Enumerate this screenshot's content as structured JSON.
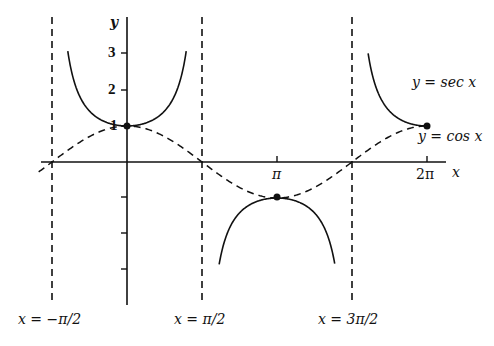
{
  "chart_data": {
    "type": "line",
    "title": "",
    "xlabel": "x",
    "ylabel": "y",
    "x_ticks": [
      {
        "value": 3.14159,
        "label": "π"
      },
      {
        "value": 6.28318,
        "label": "2π"
      }
    ],
    "y_ticks": [
      {
        "value": 1,
        "label": "1"
      },
      {
        "value": 2,
        "label": "2"
      },
      {
        "value": 3,
        "label": "3"
      },
      {
        "value": -1,
        "label": ""
      },
      {
        "value": -2,
        "label": ""
      },
      {
        "value": -3,
        "label": ""
      }
    ],
    "xlim": [
      -1.97,
      7.3
    ],
    "ylim": [
      -4.0,
      4.0
    ],
    "grid": false,
    "series": [
      {
        "name": "y = sec x",
        "style": "solid",
        "domain": [
          -1.24,
          7.85
        ],
        "segments": [
          [
            -1.24,
            1.24
          ],
          [
            1.93,
            4.35
          ],
          [
            5.05,
            6.2832
          ]
        ]
      },
      {
        "name": "y = cos x",
        "style": "dashed",
        "domain": [
          -1.85,
          6.2832
        ]
      }
    ],
    "asymptotes": [
      {
        "x": -1.5708,
        "label": "x = −π/2"
      },
      {
        "x": 1.5708,
        "label": "x = π/2"
      },
      {
        "x": 4.7124,
        "label": "x = 3π/2"
      }
    ],
    "points": [
      {
        "x": 0,
        "y": 1
      },
      {
        "x": 3.14159,
        "y": -1
      },
      {
        "x": 6.28318,
        "y": 1
      }
    ],
    "annotations": [
      {
        "text": "y = sec x",
        "near": [
          6.3,
          1.9
        ]
      },
      {
        "text": "y = cos x",
        "near": [
          6.3,
          0.6
        ]
      }
    ]
  },
  "labels": {
    "y_axis": "y",
    "x_axis": "x",
    "tick_1": "1",
    "tick_2": "2",
    "tick_3": "3",
    "tick_pi": "π",
    "tick_2pi": "2π",
    "sec_label": "y = sec x",
    "cos_label": "y = cos x",
    "asym_left": "x = −π/2",
    "asym_mid": "x = π/2",
    "asym_right": "x = 3π/2"
  }
}
